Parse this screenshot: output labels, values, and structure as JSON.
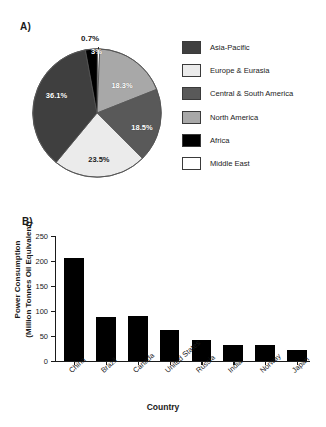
{
  "figure": {
    "panel_a_label": "A)",
    "panel_b_label": "B)"
  },
  "legend": {
    "items": [
      {
        "label": "Asia-Pacific",
        "color": "#3f3f3f"
      },
      {
        "label": "Europe & Eurasia",
        "color": "#ebebeb"
      },
      {
        "label": "Central & South America",
        "color": "#595959"
      },
      {
        "label": "North America",
        "color": "#a8a8a8"
      },
      {
        "label": "Africa",
        "color": "#000000"
      },
      {
        "label": "Middle East",
        "color": "#ffffff"
      }
    ]
  },
  "chart_data": [
    {
      "type": "pie",
      "title": "",
      "panel": "A)",
      "legend_position": "right",
      "categories": [
        "Asia-Pacific",
        "North America",
        "Central & South America",
        "Europe & Eurasia",
        "Africa",
        "Middle East"
      ],
      "values": [
        36.1,
        18.3,
        18.5,
        23.5,
        3.0,
        0.7
      ],
      "labels": [
        "36.1%",
        "18.3%",
        "18.5%",
        "23.5%",
        "3%",
        "0.7%"
      ],
      "colors": [
        "#3f3f3f",
        "#a8a8a8",
        "#595959",
        "#ebebeb",
        "#000000",
        "#ffffff"
      ],
      "units": "percent"
    },
    {
      "type": "bar",
      "panel": "B)",
      "title": "",
      "xlabel": "Country",
      "ylabel": "Power Consumption\n(Million Tonnes Oil Equivalent)",
      "ylabel_line1": "Power Consumption",
      "ylabel_line2": "(Million Tonnes Oil Equivalent)",
      "categories": [
        "China",
        "Brazil",
        "Canada",
        "United States",
        "Russia",
        "India",
        "Norway",
        "Japan"
      ],
      "values": [
        206,
        88,
        90,
        63,
        43,
        32,
        32,
        22
      ],
      "ylim": [
        0,
        250
      ],
      "yticks": [
        0,
        50,
        100,
        150,
        200,
        250
      ],
      "ytick_labels": [
        "0",
        "50",
        "100",
        "150",
        "200",
        "250"
      ],
      "grid": false,
      "bar_color": "#000000"
    }
  ]
}
